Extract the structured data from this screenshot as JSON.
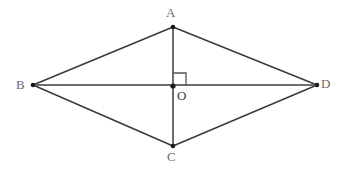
{
  "figure": {
    "shape_type": "rhombus",
    "background_color": "#ffffff",
    "edge_color": "#3a3a3a",
    "diagonal_color": "#6e6e6e",
    "vertical_diagonal_color": "#6e6e6e",
    "point_color": "#1a1a1a",
    "label_color": "#6b6b6b",
    "center_label_color": "#3c3c3c",
    "right_angle_marker": {
      "name": "right-angle-at-O",
      "size": 13,
      "orientation": "upper-right",
      "color": "#555555"
    },
    "points": {
      "A": {
        "label": "A",
        "x": 173,
        "y": 27
      },
      "B": {
        "label": "B",
        "x": 33,
        "y": 85
      },
      "C": {
        "label": "C",
        "x": 173,
        "y": 146
      },
      "D": {
        "label": "D",
        "x": 317,
        "y": 85
      },
      "O": {
        "label": "O",
        "x": 173,
        "y": 86
      }
    },
    "edges": [
      {
        "name": "side-AB",
        "from": "A",
        "to": "B"
      },
      {
        "name": "side-AD",
        "from": "A",
        "to": "D"
      },
      {
        "name": "side-BC",
        "from": "B",
        "to": "C"
      },
      {
        "name": "side-CD",
        "from": "C",
        "to": "D"
      }
    ],
    "diagonals": [
      {
        "name": "diagonal-BD",
        "from": "B",
        "to": "D"
      },
      {
        "name": "diagonal-AC",
        "from": "A",
        "to": "C"
      }
    ]
  }
}
